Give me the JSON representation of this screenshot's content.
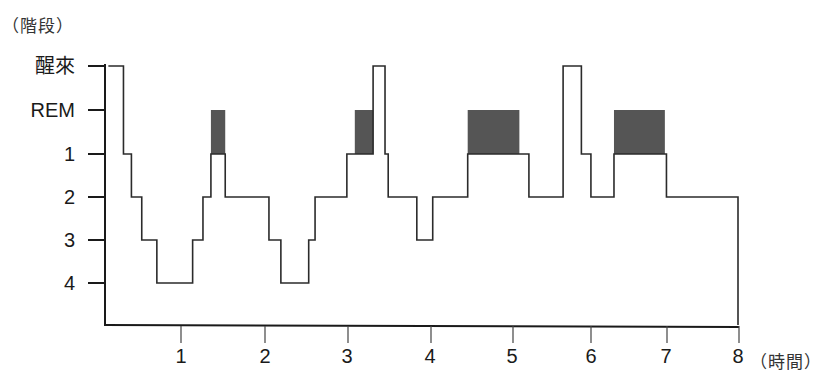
{
  "chart_data": {
    "type": "line",
    "subtype": "step (hypnogram)",
    "title": "",
    "ylabel": "（階段）",
    "xlabel": "（時間）",
    "y_categories": [
      "醒來",
      "REM",
      "1",
      "2",
      "3",
      "4"
    ],
    "x_ticks": [
      1,
      2,
      3,
      4,
      5,
      6,
      7,
      8
    ],
    "xlim": [
      0,
      8
    ],
    "grid": false,
    "legend": null,
    "colors": {
      "line": "#2b2b2b",
      "rem_fill": "#555555",
      "axis": "#1a1a1a"
    },
    "steps": [
      {
        "start": 0.08,
        "end": 0.27,
        "stage": "醒來"
      },
      {
        "start": 0.27,
        "end": 0.37,
        "stage": "1"
      },
      {
        "start": 0.37,
        "end": 0.5,
        "stage": "2"
      },
      {
        "start": 0.5,
        "end": 0.69,
        "stage": "3"
      },
      {
        "start": 0.69,
        "end": 1.14,
        "stage": "4"
      },
      {
        "start": 1.14,
        "end": 1.27,
        "stage": "3"
      },
      {
        "start": 1.27,
        "end": 1.37,
        "stage": "2"
      },
      {
        "start": 1.37,
        "end": 1.55,
        "stage": "1",
        "rem": true
      },
      {
        "start": 1.55,
        "end": 2.1,
        "stage": "2"
      },
      {
        "start": 2.1,
        "end": 2.25,
        "stage": "3"
      },
      {
        "start": 2.25,
        "end": 2.6,
        "stage": "4"
      },
      {
        "start": 2.6,
        "end": 2.68,
        "stage": "3"
      },
      {
        "start": 2.68,
        "end": 3.08,
        "stage": "2"
      },
      {
        "start": 3.08,
        "end": 3.41,
        "stage": "1",
        "rem_from": 3.18
      },
      {
        "start": 3.41,
        "end": 3.56,
        "stage": "醒來"
      },
      {
        "start": 3.56,
        "end": 3.6,
        "stage": "1"
      },
      {
        "start": 3.6,
        "end": 3.96,
        "stage": "2"
      },
      {
        "start": 3.96,
        "end": 4.16,
        "stage": "3"
      },
      {
        "start": 4.16,
        "end": 4.6,
        "stage": "2"
      },
      {
        "start": 4.6,
        "end": 5.37,
        "stage": "1",
        "rem_to": 5.25
      },
      {
        "start": 5.37,
        "end": 5.8,
        "stage": "2"
      },
      {
        "start": 5.8,
        "end": 6.03,
        "stage": "醒來"
      },
      {
        "start": 6.03,
        "end": 6.15,
        "stage": "1"
      },
      {
        "start": 6.15,
        "end": 6.44,
        "stage": "2"
      },
      {
        "start": 6.44,
        "end": 7.1,
        "stage": "1",
        "rem": true
      },
      {
        "start": 7.1,
        "end": 8.0,
        "stage": "2"
      }
    ],
    "rem_periods": [
      {
        "start": 1.37,
        "end": 1.55
      },
      {
        "start": 3.18,
        "end": 3.41
      },
      {
        "start": 4.6,
        "end": 5.25
      },
      {
        "start": 6.44,
        "end": 7.08
      }
    ]
  },
  "labels": {
    "y_unit": "（階段）",
    "x_unit": "（時間）",
    "y_ticks": [
      "醒來",
      "REM",
      "1",
      "2",
      "3",
      "4"
    ],
    "x_ticks": [
      "1",
      "2",
      "3",
      "4",
      "5",
      "6",
      "7",
      "8"
    ]
  }
}
